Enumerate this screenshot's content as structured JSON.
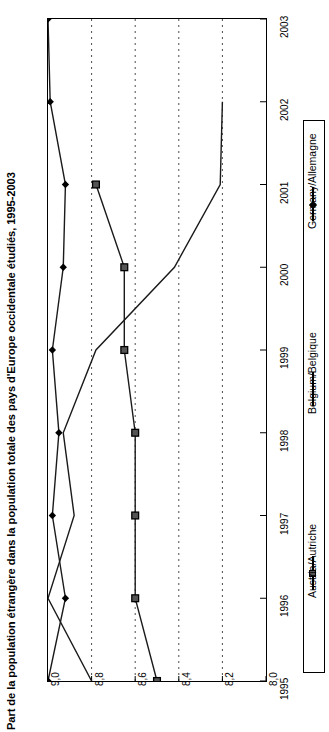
{
  "chart_data": {
    "type": "line",
    "title": "Part de la population étrangère dans la population totale des pays d'Europe occidentale étudiés, 1995-2003",
    "orientation": "horizontal-values-vertical-years",
    "xlabel": "",
    "ylabel": "",
    "categories": [
      "1995",
      "1996",
      "1997",
      "1998",
      "1999",
      "2000",
      "2001",
      "2002",
      "2003"
    ],
    "value_ticks": [
      "9,0",
      "8,8",
      "8,6",
      "8,4",
      "8,2",
      "8,0"
    ],
    "value_tick_numbers": [
      9.0,
      8.8,
      8.6,
      8.4,
      8.2,
      8.0
    ],
    "xlim": [
      9.0,
      8.0
    ],
    "axis_reversed": true,
    "grid": "dotted-vertical",
    "legend_position": "right",
    "series": [
      {
        "name": "Austria/Autriche",
        "marker": "square",
        "x": [
          "1995",
          "1996",
          "1997",
          "1998",
          "1999",
          "2000",
          "2001"
        ],
        "values": [
          8.5,
          8.6,
          8.6,
          8.6,
          8.65,
          8.65,
          8.78
        ]
      },
      {
        "name": "Belgium/Belgique",
        "marker": "none",
        "x": [
          "1995",
          "1996",
          "1997",
          "1998",
          "1999",
          "2000",
          "2001",
          "2002"
        ],
        "values": [
          8.8,
          9.0,
          8.88,
          8.93,
          8.78,
          8.42,
          8.21,
          8.2
        ]
      },
      {
        "name": "Germany/Allemagne",
        "marker": "diamond",
        "x": [
          "1995",
          "1996",
          "1997",
          "1998",
          "1999",
          "2000",
          "2001",
          "2002",
          "2003"
        ],
        "values": [
          9.0,
          8.92,
          8.98,
          8.95,
          8.98,
          8.93,
          8.92,
          8.99,
          9.0
        ]
      }
    ]
  },
  "legend": {
    "entries": [
      {
        "label": "Austria/Autriche",
        "marker": "square"
      },
      {
        "label": "Belgium/Belgique",
        "marker": "line"
      },
      {
        "label": "Germany/Allemagne",
        "marker": "diamond"
      }
    ]
  },
  "colors": {
    "axis": "#000000",
    "series_line": "#1a1a1a",
    "grid": "#4d4d4d",
    "marker_fill": "#555555",
    "background": "#ffffff"
  }
}
